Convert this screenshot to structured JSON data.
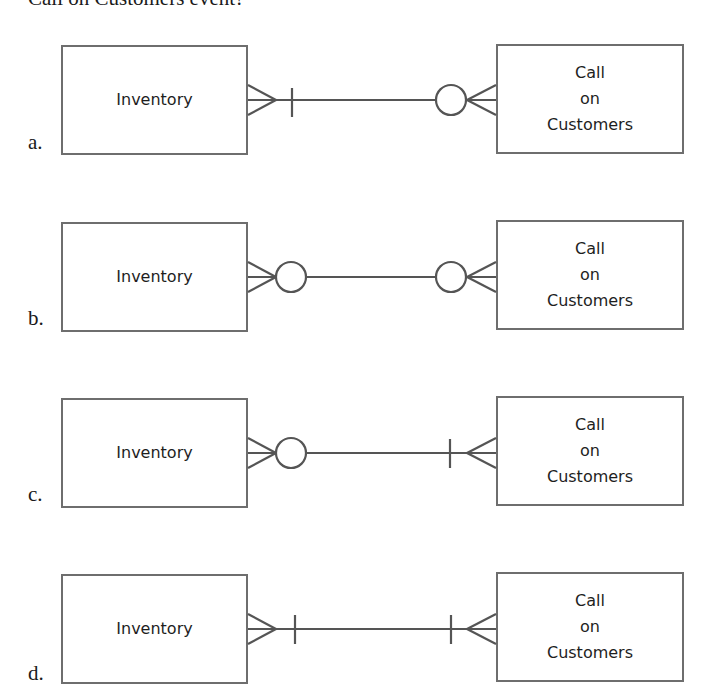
{
  "question": {
    "stem_fragment": "Call on Customers event?"
  },
  "diagram": {
    "left_entity": "Inventory",
    "right_entity_lines": [
      "Call",
      "on",
      "Customers"
    ],
    "line_color": "#555555",
    "box_border_color": "#6e6e6e"
  },
  "options": [
    {
      "letter": "a.",
      "left_entity": "Inventory",
      "right_entity_lines": [
        "Call",
        "on",
        "Customers"
      ],
      "left_end": {
        "max": "many",
        "min": "one (mandatory)"
      },
      "right_end": {
        "max": "many",
        "min": "zero (optional)"
      }
    },
    {
      "letter": "b.",
      "left_entity": "Inventory",
      "right_entity_lines": [
        "Call",
        "on",
        "Customers"
      ],
      "left_end": {
        "max": "many",
        "min": "zero (optional)"
      },
      "right_end": {
        "max": "many",
        "min": "zero (optional)"
      }
    },
    {
      "letter": "c.",
      "left_entity": "Inventory",
      "right_entity_lines": [
        "Call",
        "on",
        "Customers"
      ],
      "left_end": {
        "max": "many",
        "min": "zero (optional)"
      },
      "right_end": {
        "max": "many",
        "min": "one (mandatory)"
      }
    },
    {
      "letter": "d.",
      "left_entity": "Inventory",
      "right_entity_lines": [
        "Call",
        "on",
        "Customers"
      ],
      "left_end": {
        "max": "many",
        "min": "one (mandatory)"
      },
      "right_end": {
        "max": "many",
        "min": "one (mandatory)"
      }
    }
  ]
}
